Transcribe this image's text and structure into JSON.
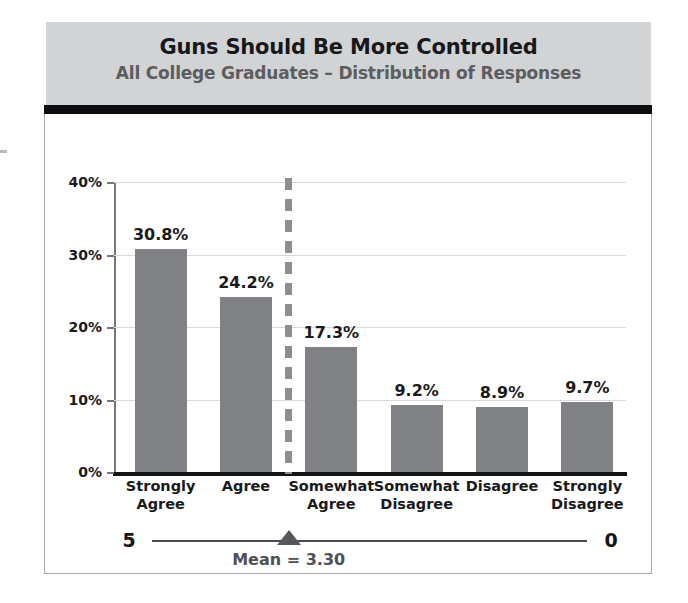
{
  "chart_data": {
    "type": "bar",
    "title": "Guns Should Be More Controlled",
    "subtitle": "All College Graduates – Distribution of Responses",
    "categories": [
      "Strongly\nAgree",
      "Agree",
      "Somewhat\nAgree",
      "Somewhat\nDisagree",
      "Disagree",
      "Strongly\nDisagree"
    ],
    "category_lines": [
      [
        "Strongly",
        "Agree"
      ],
      [
        "Agree",
        ""
      ],
      [
        "Somewhat",
        "Agree"
      ],
      [
        "Somewhat",
        "Disagree"
      ],
      [
        "Disagree",
        ""
      ],
      [
        "Strongly",
        "Disagree"
      ]
    ],
    "values": [
      30.8,
      24.2,
      17.3,
      9.2,
      8.9,
      9.7
    ],
    "value_labels": [
      "30.8%",
      "24.2%",
      "17.3%",
      "9.2%",
      "8.9%",
      "9.7%"
    ],
    "xlabel": "",
    "ylabel": "",
    "ylim": [
      0,
      40
    ],
    "ytick_labels": [
      "40%",
      "30%",
      "20%",
      "10%",
      "0%"
    ],
    "ytick_values": [
      40,
      30,
      20,
      10,
      0
    ],
    "grid": true,
    "legend": "none",
    "bar_color": "#808184",
    "annotations": {
      "mean_value": 3.3,
      "mean_label": "Mean = 3.30",
      "scale_left": "5",
      "scale_right": "0",
      "divider_note": "dashed vertical line at mean position between Agree and Somewhat Agree"
    }
  },
  "colors": {
    "header_band": "#d2d3d5",
    "header_rule": "#0d0d0f",
    "title_text": "#18181a",
    "subtitle_text": "#5c5d60",
    "bar_fill": "#808184",
    "gridline": "#d8d9db",
    "axis": "#141416",
    "mean_marker": "#56575a"
  }
}
